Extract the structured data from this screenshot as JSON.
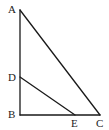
{
  "diagram": {
    "type": "geometry-triangle",
    "stroke_color": "#1a1a1a",
    "points": {
      "A": {
        "label": "A",
        "x": 20,
        "y": 10
      },
      "D": {
        "label": "D",
        "x": 20,
        "y": 77
      },
      "B": {
        "label": "B",
        "x": 20,
        "y": 115
      },
      "E": {
        "label": "E",
        "x": 75,
        "y": 115
      },
      "C": {
        "label": "C",
        "x": 100,
        "y": 115
      }
    },
    "segments": [
      [
        "A",
        "B"
      ],
      [
        "B",
        "C"
      ],
      [
        "A",
        "C"
      ],
      [
        "D",
        "E"
      ]
    ],
    "labels": {
      "A": "A",
      "B": "B",
      "C": "C",
      "D": "D",
      "E": "E"
    }
  }
}
